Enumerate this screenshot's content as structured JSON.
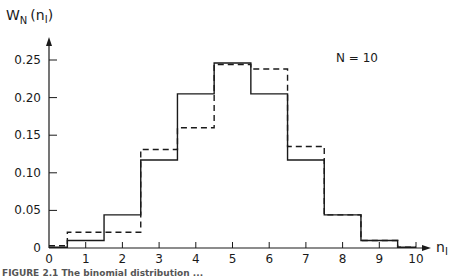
{
  "chart_data": {
    "type": "bar",
    "subtype": "step-histogram",
    "title": "",
    "annotation": "N = 10",
    "xlabel": "n1",
    "ylabel": "WN (n1)",
    "x": [
      0,
      1,
      2,
      3,
      4,
      5,
      6,
      7,
      8,
      9,
      10
    ],
    "xticks": [
      "0",
      "1",
      "2",
      "3",
      "4",
      "5",
      "6",
      "7",
      "8",
      "9",
      "10"
    ],
    "yticks": [
      "0",
      "0.05",
      "0.10",
      "0.15",
      "0.20",
      "0.25"
    ],
    "xlim": [
      0,
      10
    ],
    "ylim": [
      0,
      0.27
    ],
    "grid": false,
    "series": [
      {
        "name": "solid",
        "style": "solid",
        "values": [
          0.001,
          0.01,
          0.044,
          0.117,
          0.205,
          0.246,
          0.205,
          0.117,
          0.044,
          0.01,
          0.001
        ]
      },
      {
        "name": "dashed",
        "style": "dashed",
        "values": [
          0.003,
          0.021,
          0.021,
          0.131,
          0.16,
          0.244,
          0.238,
          0.135,
          0.044,
          0.01,
          0.001
        ]
      }
    ]
  },
  "labels": {
    "ylabel_main": "W",
    "ylabel_sub": "N",
    "ylabel_arg": "(n",
    "ylabel_arg_sub": "I",
    "ylabel_close": ")",
    "xlabel_main": "n",
    "xlabel_sub": "I",
    "annotation": "N = 10"
  },
  "caption": "FIGURE 2.1   The binomial distribution ..."
}
